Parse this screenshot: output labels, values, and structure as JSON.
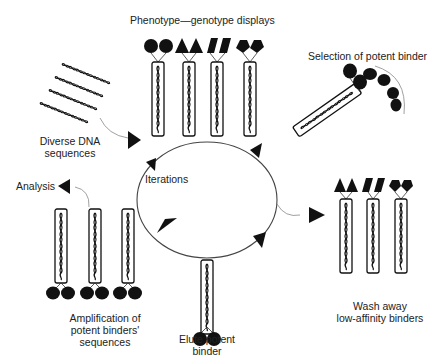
{
  "diagram": {
    "center_label": "Iterations",
    "steps": [
      {
        "id": "display",
        "label": "Phenotype—genotype displays"
      },
      {
        "id": "selection",
        "label": "Selection of potent binder"
      },
      {
        "id": "wash",
        "label_line1": "Wash away",
        "label_line2": "low-affinity binders"
      },
      {
        "id": "elute",
        "label_line1": "Elute potent",
        "label_line2": "binder"
      },
      {
        "id": "amplify",
        "label_line1": "Amplification of",
        "label_line2": "potent binders'",
        "label_line3": "sequences"
      },
      {
        "id": "diverse",
        "label_line1": "Diverse DNA",
        "label_line2": "sequences"
      },
      {
        "id": "analysis",
        "label": "Analysis"
      }
    ],
    "colors": {
      "ink": "#111111",
      "line": "#555555",
      "text": "#222222"
    }
  }
}
